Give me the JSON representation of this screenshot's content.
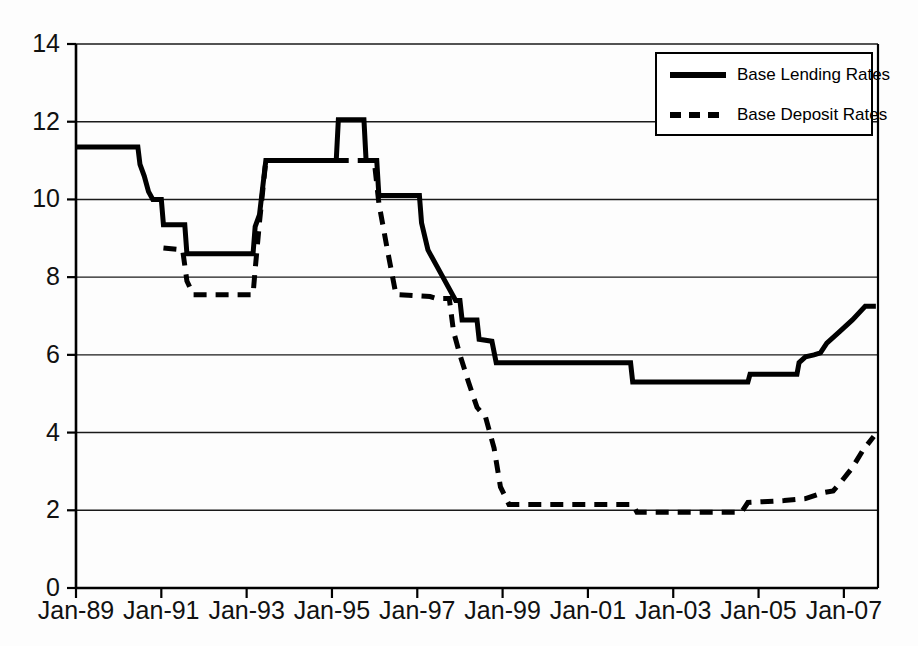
{
  "chart_data": {
    "type": "line",
    "title": "",
    "subtitle": "",
    "xlabel": "",
    "ylabel": "",
    "xlim": [
      1989.0,
      2007.8
    ],
    "ylim": [
      0,
      14
    ],
    "grid": true,
    "grid_axis": "y",
    "legend_position": "top-right",
    "y_ticks": [
      0,
      2,
      4,
      6,
      8,
      10,
      12,
      14
    ],
    "y_tick_labels": [
      "0",
      "2",
      "4",
      "6",
      "8",
      "10",
      "12",
      "14"
    ],
    "x_ticks": [
      1989,
      1991,
      1993,
      1995,
      1997,
      1999,
      2001,
      2003,
      2005,
      2007
    ],
    "x_tick_labels": [
      "Jan-89",
      "Jan-91",
      "Jan-93",
      "Jan-95",
      "Jan-97",
      "Jan-99",
      "Jan-01",
      "Jan-03",
      "Jan-05",
      "Jan-07"
    ],
    "series": [
      {
        "name": "Base Lending Rates",
        "style": "solid",
        "color": "#000000",
        "width": 5,
        "points": [
          [
            1989.0,
            11.35
          ],
          [
            1990.45,
            11.35
          ],
          [
            1990.5,
            10.9
          ],
          [
            1990.6,
            10.6
          ],
          [
            1990.7,
            10.2
          ],
          [
            1990.8,
            10.0
          ],
          [
            1991.0,
            10.0
          ],
          [
            1991.05,
            9.35
          ],
          [
            1991.55,
            9.35
          ],
          [
            1991.6,
            8.6
          ],
          [
            1993.15,
            8.6
          ],
          [
            1993.2,
            9.3
          ],
          [
            1993.3,
            9.6
          ],
          [
            1993.45,
            11.0
          ],
          [
            1995.1,
            11.0
          ],
          [
            1995.15,
            12.05
          ],
          [
            1995.75,
            12.05
          ],
          [
            1995.8,
            11.0
          ],
          [
            1996.05,
            11.0
          ],
          [
            1996.1,
            10.1
          ],
          [
            1997.05,
            10.1
          ],
          [
            1997.1,
            9.4
          ],
          [
            1997.25,
            8.7
          ],
          [
            1997.3,
            8.6
          ],
          [
            1997.6,
            8.0
          ],
          [
            1997.9,
            7.4
          ],
          [
            1998.0,
            7.4
          ],
          [
            1998.05,
            6.9
          ],
          [
            1998.4,
            6.9
          ],
          [
            1998.45,
            6.4
          ],
          [
            1998.75,
            6.35
          ],
          [
            1998.85,
            5.8
          ],
          [
            2002.0,
            5.8
          ],
          [
            2002.05,
            5.3
          ],
          [
            2004.75,
            5.3
          ],
          [
            2004.8,
            5.5
          ],
          [
            2005.9,
            5.5
          ],
          [
            2005.95,
            5.8
          ],
          [
            2006.1,
            5.95
          ],
          [
            2006.3,
            6.0
          ],
          [
            2006.45,
            6.05
          ],
          [
            2006.6,
            6.3
          ],
          [
            2006.9,
            6.6
          ],
          [
            2007.2,
            6.9
          ],
          [
            2007.5,
            7.25
          ],
          [
            2007.75,
            7.25
          ]
        ]
      },
      {
        "name": "Base Deposit Rates",
        "style": "dashed",
        "color": "#000000",
        "width": 5,
        "points": [
          [
            1991.05,
            8.75
          ],
          [
            1991.5,
            8.7
          ],
          [
            1991.6,
            7.9
          ],
          [
            1991.75,
            7.55
          ],
          [
            1993.15,
            7.55
          ],
          [
            1993.2,
            8.2
          ],
          [
            1993.3,
            9.4
          ],
          [
            1993.45,
            11.0
          ],
          [
            1995.9,
            11.0
          ],
          [
            1996.0,
            10.9
          ],
          [
            1996.1,
            9.9
          ],
          [
            1996.3,
            8.7
          ],
          [
            1996.5,
            7.55
          ],
          [
            1997.3,
            7.5
          ],
          [
            1997.45,
            7.45
          ],
          [
            1997.75,
            7.45
          ],
          [
            1997.85,
            6.6
          ],
          [
            1998.0,
            6.0
          ],
          [
            1998.2,
            5.3
          ],
          [
            1998.4,
            4.65
          ],
          [
            1998.6,
            4.4
          ],
          [
            1998.8,
            3.6
          ],
          [
            1998.95,
            2.6
          ],
          [
            1999.15,
            2.15
          ],
          [
            2002.05,
            2.15
          ],
          [
            2002.15,
            1.95
          ],
          [
            2004.6,
            1.95
          ],
          [
            2004.75,
            2.2
          ],
          [
            2005.6,
            2.25
          ],
          [
            2006.1,
            2.3
          ],
          [
            2006.5,
            2.45
          ],
          [
            2006.75,
            2.5
          ],
          [
            2006.95,
            2.75
          ],
          [
            2007.2,
            3.1
          ],
          [
            2007.45,
            3.55
          ],
          [
            2007.7,
            3.9
          ]
        ]
      }
    ],
    "legend": [
      {
        "label": "Base Lending Rates",
        "style": "solid",
        "swatch": "solid-line-swatch"
      },
      {
        "label": "Base Deposit Rates",
        "style": "dashed",
        "swatch": "dashed-line-swatch"
      }
    ]
  },
  "axes": {
    "plot_left": 76,
    "plot_right": 878,
    "plot_top": 44,
    "plot_bottom": 588
  }
}
